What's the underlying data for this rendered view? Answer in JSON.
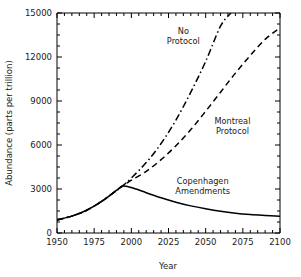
{
  "chart_data": {
    "type": "line",
    "title": "",
    "xlabel": "Year",
    "ylabel": "Abundance (parts per trillion)",
    "xlim": [
      1950,
      2100
    ],
    "ylim": [
      0,
      15000
    ],
    "grid": false,
    "legend_position": "inline-annotations",
    "x_major_ticks": [
      1950,
      1975,
      2000,
      2025,
      2050,
      2075,
      2100
    ],
    "x_tick_labels": [
      "1950",
      "1975",
      "2000",
      "2025",
      "2050",
      "2075",
      "2100"
    ],
    "x_minor_tick_interval": 5,
    "y_major_ticks": [
      0,
      3000,
      6000,
      9000,
      12000,
      15000
    ],
    "y_tick_labels": [
      "0",
      "3000",
      "6000",
      "9000",
      "12000",
      "15000"
    ],
    "y_minor_tick_interval": 750,
    "series": [
      {
        "name": "No Protocol",
        "style": "dash-dot",
        "label_lines": [
          "No",
          "Protocol"
        ],
        "x": [
          1950,
          1960,
          1970,
          1980,
          1990,
          1994,
          2000,
          2010,
          2020,
          2030,
          2040,
          2050,
          2060,
          2067
        ],
        "values": [
          900,
          1150,
          1550,
          2150,
          2900,
          3200,
          3750,
          4800,
          6100,
          7700,
          9600,
          11700,
          14100,
          15000
        ]
      },
      {
        "name": "Montreal Protocol",
        "style": "dashed",
        "label_lines": [
          "Montreal",
          "Protocol"
        ],
        "x": [
          1950,
          1960,
          1970,
          1980,
          1990,
          1994,
          2000,
          2010,
          2020,
          2030,
          2040,
          2050,
          2060,
          2070,
          2080,
          2090,
          2100
        ],
        "values": [
          900,
          1150,
          1550,
          2150,
          2900,
          3200,
          3600,
          4200,
          5000,
          5950,
          7050,
          8300,
          9600,
          10900,
          12100,
          13200,
          14000
        ]
      },
      {
        "name": "Copenhagen Amendments",
        "style": "solid",
        "label_lines": [
          "Copenhagen",
          "Amendments"
        ],
        "x": [
          1950,
          1960,
          1970,
          1980,
          1990,
          1994,
          2000,
          2010,
          2020,
          2030,
          2040,
          2050,
          2060,
          2070,
          2080,
          2090,
          2100
        ],
        "values": [
          900,
          1150,
          1550,
          2150,
          2900,
          3200,
          3100,
          2750,
          2400,
          2100,
          1850,
          1650,
          1480,
          1350,
          1260,
          1200,
          1150
        ]
      }
    ],
    "annotations": [
      {
        "text": "No Protocol",
        "x": 2035,
        "y": 13600
      },
      {
        "text": "Montreal Protocol",
        "x": 2068,
        "y": 7400
      },
      {
        "text": "Copenhagen Amendments",
        "x": 2048,
        "y": 3350
      }
    ]
  }
}
